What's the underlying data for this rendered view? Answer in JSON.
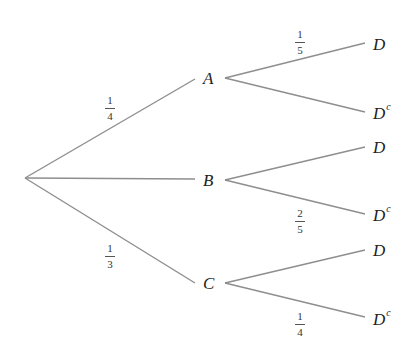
{
  "diagram": {
    "type": "probability-tree",
    "root": {
      "x": 25,
      "y": 178
    },
    "first_level": [
      {
        "id": "A",
        "label": "A",
        "prob": {
          "num": "1",
          "den": "4"
        },
        "y": 78
      },
      {
        "id": "B",
        "label": "B",
        "prob": null,
        "y": 180
      },
      {
        "id": "C",
        "label": "C",
        "prob": {
          "num": "1",
          "den": "3"
        },
        "y": 283
      }
    ],
    "second_level": [
      {
        "parent": "A",
        "label": "D",
        "sup": "",
        "prob": {
          "num": "1",
          "den": "5"
        },
        "y": 44
      },
      {
        "parent": "A",
        "label": "D",
        "sup": "c",
        "prob": null,
        "y": 112
      },
      {
        "parent": "B",
        "label": "D",
        "sup": "",
        "prob": null,
        "y": 147
      },
      {
        "parent": "B",
        "label": "D",
        "sup": "c",
        "prob": {
          "num": "2",
          "den": "5"
        },
        "y": 214
      },
      {
        "parent": "C",
        "label": "D",
        "sup": "",
        "prob": null,
        "y": 250
      },
      {
        "parent": "C",
        "label": "D",
        "sup": "c",
        "prob": {
          "num": "1",
          "den": "4"
        },
        "y": 318
      }
    ],
    "colors": {
      "edge": "#8e8e8e",
      "text": "#222222"
    }
  }
}
